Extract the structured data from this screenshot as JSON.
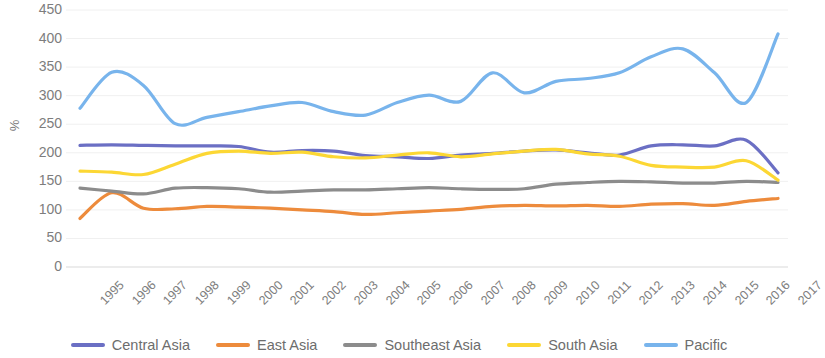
{
  "chart_data": {
    "type": "line",
    "title": "",
    "xlabel": "",
    "ylabel": "%",
    "ylim": [
      0,
      450
    ],
    "yticks": [
      450,
      400,
      350,
      300,
      250,
      200,
      150,
      100,
      50,
      0
    ],
    "grid": true,
    "legend_position": "bottom",
    "categories": [
      "1995",
      "1996",
      "1997",
      "1998",
      "1999",
      "2000",
      "2001",
      "2002",
      "2003",
      "2004",
      "2005",
      "2006",
      "2007",
      "2008",
      "2009",
      "2010",
      "2011",
      "2012",
      "2013",
      "2014",
      "2015",
      "2016",
      "2017"
    ],
    "series": [
      {
        "name": "Central Asia",
        "color": "#6B6FC4",
        "values": [
          213,
          214,
          213,
          212,
          212,
          211,
          201,
          204,
          203,
          195,
          193,
          190,
          196,
          199,
          203,
          205,
          200,
          196,
          212,
          214,
          212,
          222,
          165
        ]
      },
      {
        "name": "East Asia",
        "color": "#ED8B3C",
        "values": [
          85,
          130,
          103,
          102,
          106,
          105,
          103,
          100,
          97,
          92,
          95,
          98,
          101,
          106,
          108,
          107,
          108,
          106,
          110,
          111,
          108,
          115,
          120
        ]
      },
      {
        "name": "Southeast Asia",
        "color": "#8C8C8C",
        "values": [
          138,
          133,
          128,
          138,
          139,
          137,
          131,
          133,
          135,
          135,
          137,
          139,
          137,
          136,
          137,
          145,
          148,
          150,
          149,
          147,
          147,
          150,
          148
        ]
      },
      {
        "name": "South Asia",
        "color": "#FCD734",
        "values": [
          168,
          166,
          162,
          180,
          199,
          203,
          199,
          201,
          193,
          191,
          196,
          200,
          193,
          198,
          203,
          206,
          198,
          194,
          178,
          175,
          175,
          186,
          152
        ]
      },
      {
        "name": "Pacific",
        "color": "#78B4EC",
        "values": [
          278,
          341,
          318,
          251,
          262,
          272,
          282,
          288,
          272,
          266,
          288,
          301,
          290,
          340,
          305,
          325,
          330,
          340,
          368,
          382,
          340,
          288,
          408
        ]
      }
    ]
  },
  "legend": {
    "items": [
      {
        "label": "Central Asia"
      },
      {
        "label": "East Asia"
      },
      {
        "label": "Southeast Asia"
      },
      {
        "label": "South Asia"
      },
      {
        "label": "Pacific"
      }
    ]
  }
}
